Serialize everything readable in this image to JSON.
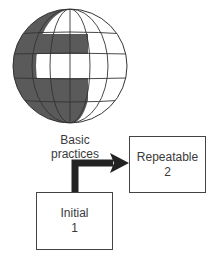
{
  "diagram": {
    "globe": {
      "label_line1": "Basic",
      "label_line2": "practices",
      "shade_color": "#5a5a5a",
      "line_color": "#333333"
    },
    "nodes": [
      {
        "id": "initial",
        "title": "Initial",
        "level": "1"
      },
      {
        "id": "repeatable",
        "title": "Repeatable",
        "level": "2"
      }
    ],
    "edges": [
      {
        "from": "initial",
        "to": "repeatable",
        "style": "thick-elbow-arrow",
        "color": "#222222"
      }
    ]
  }
}
